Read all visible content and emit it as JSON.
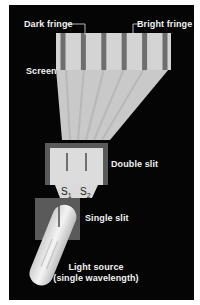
{
  "labels": {
    "dark_fringe": "Dark fringe",
    "bright_fringe": "Bright fringe",
    "screen": "Screen",
    "double_slit": "Double slit",
    "s1": "S",
    "s1_sub": "1",
    "s2": "S",
    "s2_sub": "2",
    "single_slit": "Single slit",
    "light_source_line1": "Light source",
    "light_source_line2": "(single wavelength)"
  },
  "colors": {
    "background": "#050505",
    "light": "#e6e6e6",
    "dark_fringe": "#6e6e6e",
    "slit_frame": "#5a5a5a",
    "text": "#f2f2f2"
  },
  "fringes": {
    "dark_count": 6
  }
}
